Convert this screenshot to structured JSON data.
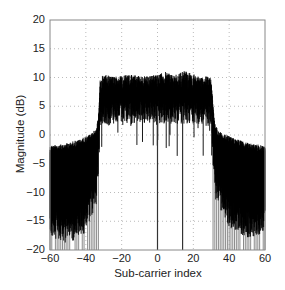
{
  "chart_data": {
    "type": "line",
    "title": "",
    "xlabel": "Sub-carrier index",
    "ylabel": "Magnitude (dB)",
    "xlim": [
      -60,
      60
    ],
    "ylim": [
      -20,
      20
    ],
    "xticks": [
      -60,
      -40,
      -20,
      0,
      20,
      40,
      60
    ],
    "yticks": [
      20,
      15,
      10,
      5,
      0,
      -5,
      -10,
      -15,
      -20
    ],
    "grid": true,
    "legend": null,
    "series": [
      {
        "name": "upper envelope",
        "x": [
          -60,
          -55,
          -50,
          -45,
          -40,
          -36,
          -34,
          -33,
          -32,
          -30,
          -25,
          -20,
          -15,
          -10,
          -5,
          0,
          5,
          10,
          15,
          20,
          25,
          28,
          30,
          31,
          32,
          34,
          36,
          40,
          45,
          50,
          55,
          60
        ],
        "values": [
          -1.8,
          -1.6,
          -1.3,
          -0.9,
          -0.3,
          0.5,
          1.5,
          3,
          10,
          10.5,
          10.2,
          10.4,
          10.5,
          10.3,
          10.2,
          10.6,
          11,
          10.5,
          11.2,
          10.6,
          10,
          10.3,
          10,
          5,
          2,
          0.8,
          0.3,
          -0.2,
          -0.8,
          -1.3,
          -1.6,
          -1.9
        ]
      },
      {
        "name": "mean level",
        "x": [
          -60,
          -50,
          -40,
          -34,
          -32,
          -20,
          0,
          20,
          30,
          32,
          40,
          50,
          60
        ],
        "values": [
          -10,
          -11,
          -9,
          -4,
          7.5,
          7.8,
          8,
          7.8,
          7.5,
          -3,
          -8,
          -10,
          -9
        ]
      }
    ],
    "nulls": [
      {
        "x": 0,
        "y": -20
      },
      {
        "x": 14,
        "y": -20
      }
    ]
  }
}
